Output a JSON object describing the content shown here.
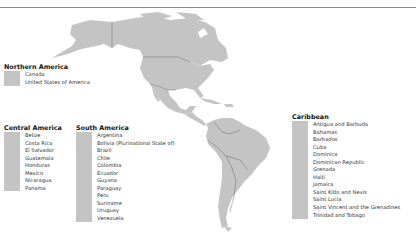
{
  "map": {
    "land_color": "#c4c4c4",
    "border_color": "#555555",
    "background": "#ffffff"
  },
  "legend": {
    "northern_america": {
      "title": "Northern America",
      "items": [
        "Canada",
        "United States of America"
      ]
    },
    "central_america": {
      "title": "Central America",
      "items": [
        "Belize",
        "Costa Rica",
        "El Salvador",
        "Guatemala",
        "Honduras",
        "Mexico",
        "Nicaragua",
        "Panama"
      ]
    },
    "south_america": {
      "title": "South America",
      "items": [
        "Argentina",
        "Bolivia (Plurinational State of)",
        "Brazil",
        "Chile",
        "Colombia",
        "Ecuador",
        "Guyana",
        "Paraguay",
        "Peru",
        "Suriname",
        "Uruguay",
        "Venezuela"
      ]
    },
    "caribbean": {
      "title": "Caribbean",
      "items": [
        "Antigua and Barbuda",
        "Bahamas",
        "Barbados",
        "Cuba",
        "Dominica",
        "Dominican Republic",
        "Grenada",
        "Haiti",
        "Jamaica",
        "Saint Kitts and Nevis",
        "Saint Lucia",
        "Saint Vincent and the Grenadines",
        "Trinidad and Tobago"
      ]
    }
  }
}
